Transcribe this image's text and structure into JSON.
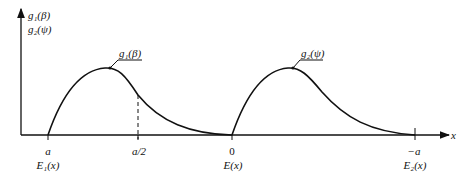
{
  "diagram": {
    "y_axis_labels": [
      "g₁(β)",
      "g₂(ψ)"
    ],
    "x_axis_label": "x",
    "curve_labels": {
      "curve1": "g₁(β)",
      "curve2": "g₂(ψ)"
    },
    "tick_labels": {
      "a": "a",
      "half_a": "a/2",
      "zero": "0",
      "neg_a": "−a"
    },
    "point_labels": {
      "e1": "E₁(x)",
      "e": "E(x)",
      "e2": "E₂(x)"
    }
  },
  "colors": {
    "line": "#111111",
    "background": "#ffffff"
  }
}
